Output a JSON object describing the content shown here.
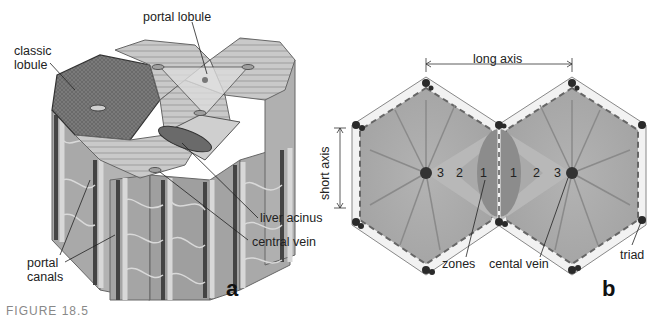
{
  "panel_a": {
    "letter": "a",
    "labels": {
      "classic_lobule": "classic\nlobule",
      "portal_lobule": "portal lobule",
      "liver_acinus": "liver acinus",
      "central_vein": "central vein",
      "portal_canals": "portal\ncanals"
    }
  },
  "panel_b": {
    "letter": "b",
    "labels": {
      "long_axis": "long axis",
      "short_axis": "short axis",
      "zones": "zones",
      "central_vein": "cental vein",
      "triad": "triad"
    },
    "zone_numbers_left": [
      "3",
      "2",
      "1"
    ],
    "zone_numbers_right": [
      "1",
      "2",
      "3"
    ]
  },
  "caption": "FIGURE 18.5"
}
